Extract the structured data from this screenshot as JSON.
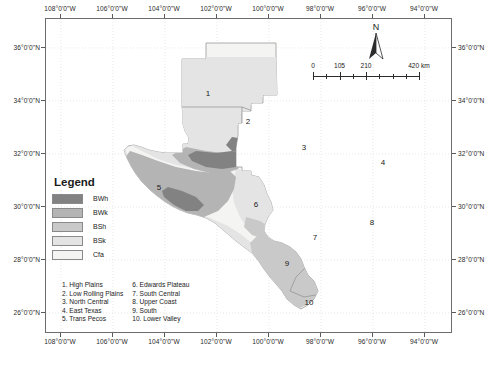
{
  "map": {
    "title_region": "Texas",
    "frame": {
      "lon_min": -108.6,
      "lon_max": -93.0,
      "lat_min": 25.3,
      "lat_max": 37.1
    },
    "longitude_labels": [
      "108°0'0\"W",
      "106°0'0\"W",
      "104°0'0\"W",
      "102°0'0\"W",
      "100°0'0\"W",
      "98°0'0\"W",
      "96°0'0\"W",
      "94°0'0\"W"
    ],
    "latitude_labels": [
      "36°0'0\"N",
      "34°0'0\"N",
      "32°0'0\"N",
      "30°0'0\"N",
      "28°0'0\"N",
      "26°0'0\"N"
    ]
  },
  "north_arrow": {
    "label": "N"
  },
  "scalebar": {
    "labels": [
      "0",
      "105",
      "210",
      "420 km"
    ],
    "unit": "km",
    "max_value": 420
  },
  "legend": {
    "title": "Legend",
    "items": [
      {
        "code": "BWh",
        "color": "#828282"
      },
      {
        "code": "BWk",
        "color": "#b4b4b4"
      },
      {
        "code": "BSh",
        "color": "#c9c9c9"
      },
      {
        "code": "BSk",
        "color": "#e4e4e4"
      },
      {
        "code": "Cfa",
        "color": "#f4f4f2"
      }
    ]
  },
  "regions": {
    "column_1": [
      "1. High Plains",
      "2. Low Rolling Plains",
      "3. North Central",
      "4. East Texas",
      "5. Trans Pecos"
    ],
    "column_2": [
      "6. Edwards Plateau",
      "7. South Central",
      "8. Upper Coast",
      "9. South",
      "10. Lower Valley"
    ],
    "markers": [
      {
        "num": "1",
        "x": 207,
        "y": 92
      },
      {
        "num": "2",
        "x": 247,
        "y": 120
      },
      {
        "num": "3",
        "x": 303,
        "y": 146
      },
      {
        "num": "4",
        "x": 382,
        "y": 161
      },
      {
        "num": "5",
        "x": 158,
        "y": 186
      },
      {
        "num": "6",
        "x": 255,
        "y": 203
      },
      {
        "num": "7",
        "x": 314,
        "y": 236
      },
      {
        "num": "8",
        "x": 371,
        "y": 221
      },
      {
        "num": "9",
        "x": 286,
        "y": 262
      },
      {
        "num": "10",
        "x": 308,
        "y": 301
      }
    ]
  },
  "chart_data": {
    "type": "map",
    "classes": [
      "BWh",
      "BWk",
      "BSh",
      "BSk",
      "Cfa"
    ],
    "divisions": [
      {
        "id": 1,
        "name": "High Plains",
        "dominant_class": "BSk"
      },
      {
        "id": 2,
        "name": "Low Rolling Plains",
        "dominant_class": "BSk"
      },
      {
        "id": 3,
        "name": "North Central",
        "dominant_class": "Cfa"
      },
      {
        "id": 4,
        "name": "East Texas",
        "dominant_class": "Cfa"
      },
      {
        "id": 5,
        "name": "Trans Pecos",
        "dominant_class": "BWk"
      },
      {
        "id": 6,
        "name": "Edwards Plateau",
        "dominant_class": "BSk"
      },
      {
        "id": 7,
        "name": "South Central",
        "dominant_class": "Cfa"
      },
      {
        "id": 8,
        "name": "Upper Coast",
        "dominant_class": "Cfa"
      },
      {
        "id": 9,
        "name": "South",
        "dominant_class": "BSh"
      },
      {
        "id": 10,
        "name": "Lower Valley",
        "dominant_class": "BSh"
      }
    ],
    "xlabel": "Longitude",
    "ylabel": "Latitude",
    "xlim": [
      -108.6,
      -93.0
    ],
    "ylim": [
      25.3,
      37.1
    ],
    "grid": true,
    "legend_position": "left-inside"
  }
}
